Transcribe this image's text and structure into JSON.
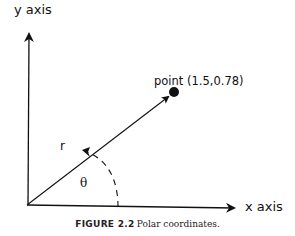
{
  "labels": {
    "y_axis": "y axis",
    "x_axis": "x axis",
    "point": "point (1.5,0.78)",
    "radius": "r",
    "angle": "θ"
  },
  "caption": {
    "label": "FIGURE 2.2",
    "text": "Polar coordinates."
  },
  "point": {
    "x": 1.5,
    "y": 0.78
  }
}
